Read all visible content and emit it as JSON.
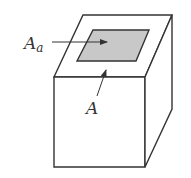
{
  "diagram": {
    "labels": {
      "apparent_area": "A",
      "apparent_area_sub": "a",
      "real_area": "A"
    },
    "colors": {
      "stroke": "#333333",
      "shaded_area": "#c8c8c8",
      "background": "#ffffff"
    }
  }
}
